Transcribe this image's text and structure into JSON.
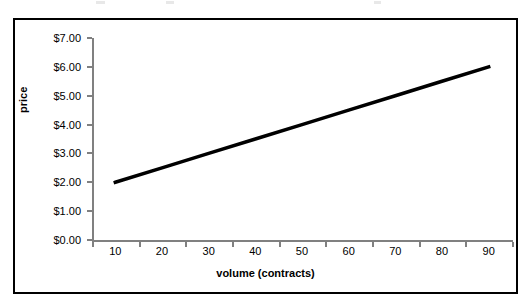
{
  "chart_data": {
    "type": "line",
    "title": "",
    "xlabel": "volume (contracts)",
    "ylabel": "price",
    "x": [
      10,
      20,
      30,
      40,
      50,
      60,
      70,
      80,
      90
    ],
    "categories": [
      "10",
      "20",
      "30",
      "40",
      "50",
      "60",
      "70",
      "80",
      "90"
    ],
    "values": [
      2.0,
      2.5,
      3.0,
      3.5,
      4.0,
      4.5,
      5.0,
      5.5,
      6.0
    ],
    "series": [
      {
        "name": "price",
        "values": [
          2.0,
          2.5,
          3.0,
          3.5,
          4.0,
          4.5,
          5.0,
          5.5,
          6.0
        ],
        "color": "#000000"
      }
    ],
    "ytick_labels": [
      "$0.00",
      "$1.00",
      "$2.00",
      "$3.00",
      "$4.00",
      "$5.00",
      "$6.00",
      "$7.00"
    ],
    "ytick_values": [
      0,
      1,
      2,
      3,
      4,
      5,
      6,
      7
    ],
    "ylim": [
      0,
      7
    ],
    "xlim": [
      10,
      90
    ],
    "grid": false,
    "legend": false,
    "legend_position": "none",
    "line_color": "#000000",
    "line_width": 3.5,
    "plot_background": "#ffffff",
    "axis_color": "#808080",
    "frame_color": "#000000",
    "annotations": []
  },
  "axes": {
    "y": {
      "title": "price",
      "ticks": [
        {
          "label": "$7.00",
          "value": 7
        },
        {
          "label": "$6.00",
          "value": 6
        },
        {
          "label": "$5.00",
          "value": 5
        },
        {
          "label": "$4.00",
          "value": 4
        },
        {
          "label": "$3.00",
          "value": 3
        },
        {
          "label": "$2.00",
          "value": 2
        },
        {
          "label": "$1.00",
          "value": 1
        },
        {
          "label": "$0.00",
          "value": 0
        }
      ]
    },
    "x": {
      "title": "volume (contracts)",
      "ticks": [
        {
          "label": "10",
          "value": 10
        },
        {
          "label": "20",
          "value": 20
        },
        {
          "label": "30",
          "value": 30
        },
        {
          "label": "40",
          "value": 40
        },
        {
          "label": "50",
          "value": 50
        },
        {
          "label": "60",
          "value": 60
        },
        {
          "label": "70",
          "value": 70
        },
        {
          "label": "80",
          "value": 80
        },
        {
          "label": "90",
          "value": 90
        }
      ]
    }
  }
}
